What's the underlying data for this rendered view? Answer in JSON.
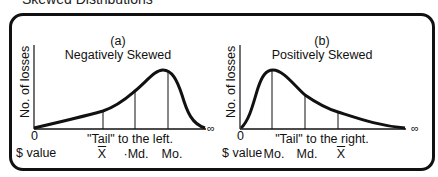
{
  "figure": {
    "title": "Skewed Distributions",
    "line_color": "#111111"
  },
  "panels": [
    {
      "id": "a",
      "label": "(a)",
      "title": "Negatively Skewed",
      "ylabel": "No. of losses",
      "origin_label": "0",
      "xlabel": "$ value",
      "infinity": "∞",
      "tail_note": "\"Tail\" to the left.",
      "markers": [
        {
          "symbol": "X",
          "overbar": true,
          "name": "mean"
        },
        {
          "symbol": "·Md.",
          "overbar": false,
          "name": "median"
        },
        {
          "symbol": "Mo.",
          "overbar": false,
          "name": "mode"
        }
      ]
    },
    {
      "id": "b",
      "label": "(b)",
      "title": "Positively Skewed",
      "ylabel": "No. of losses",
      "origin_label": "0",
      "xlabel": "$ value",
      "infinity": "∞",
      "tail_note": "\"Tail\" to the right.",
      "markers": [
        {
          "symbol": "Mo.",
          "overbar": false,
          "name": "mode"
        },
        {
          "symbol": "Md.",
          "overbar": false,
          "name": "median"
        },
        {
          "symbol": "X",
          "overbar": true,
          "name": "mean"
        }
      ]
    }
  ]
}
